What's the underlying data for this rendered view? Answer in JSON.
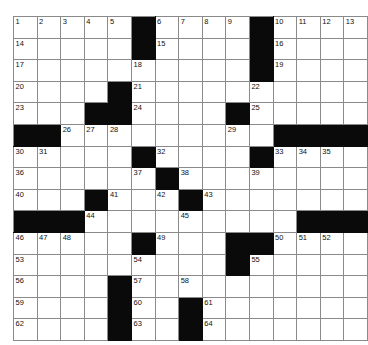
{
  "puzzle": {
    "type": "crossword-grid",
    "title": "Crossword Puzzle Grid",
    "rows": 15,
    "columns": 13,
    "colors": {
      "block": "#0a0a0a",
      "open": "#ffffff",
      "gridline": "#8a8a8a",
      "number": "#111111",
      "background": "#ffffff"
    },
    "grid": [
      [
        {
          "block": false,
          "num": "1"
        },
        {
          "block": false,
          "num": "2"
        },
        {
          "block": false,
          "num": "3"
        },
        {
          "block": false,
          "num": "4"
        },
        {
          "block": false,
          "num": "5"
        },
        {
          "block": true,
          "num": ""
        },
        {
          "block": false,
          "num": "6"
        },
        {
          "block": false,
          "num": "7"
        },
        {
          "block": false,
          "num": "8"
        },
        {
          "block": false,
          "num": "9"
        },
        {
          "block": true,
          "num": ""
        },
        {
          "block": false,
          "num": "10"
        },
        {
          "block": false,
          "num": "11"
        },
        {
          "block": false,
          "num": "12"
        },
        {
          "block": false,
          "num": "13"
        }
      ],
      [
        {
          "block": false,
          "num": "14"
        },
        {
          "block": false,
          "num": ""
        },
        {
          "block": false,
          "num": ""
        },
        {
          "block": false,
          "num": ""
        },
        {
          "block": false,
          "num": ""
        },
        {
          "block": true,
          "num": ""
        },
        {
          "block": false,
          "num": "15"
        },
        {
          "block": false,
          "num": ""
        },
        {
          "block": false,
          "num": ""
        },
        {
          "block": false,
          "num": ""
        },
        {
          "block": true,
          "num": ""
        },
        {
          "block": false,
          "num": "16"
        },
        {
          "block": false,
          "num": ""
        },
        {
          "block": false,
          "num": ""
        },
        {
          "block": false,
          "num": ""
        }
      ],
      [
        {
          "block": false,
          "num": "17"
        },
        {
          "block": false,
          "num": ""
        },
        {
          "block": false,
          "num": ""
        },
        {
          "block": false,
          "num": ""
        },
        {
          "block": false,
          "num": ""
        },
        {
          "block": false,
          "num": "18"
        },
        {
          "block": false,
          "num": ""
        },
        {
          "block": false,
          "num": ""
        },
        {
          "block": false,
          "num": ""
        },
        {
          "block": false,
          "num": ""
        },
        {
          "block": true,
          "num": ""
        },
        {
          "block": false,
          "num": "19"
        },
        {
          "block": false,
          "num": ""
        },
        {
          "block": false,
          "num": ""
        },
        {
          "block": false,
          "num": ""
        }
      ],
      [
        {
          "block": false,
          "num": "20"
        },
        {
          "block": false,
          "num": ""
        },
        {
          "block": false,
          "num": ""
        },
        {
          "block": false,
          "num": ""
        },
        {
          "block": true,
          "num": ""
        },
        {
          "block": false,
          "num": "21"
        },
        {
          "block": false,
          "num": ""
        },
        {
          "block": false,
          "num": ""
        },
        {
          "block": false,
          "num": ""
        },
        {
          "block": false,
          "num": ""
        },
        {
          "block": false,
          "num": "22"
        },
        {
          "block": false,
          "num": ""
        },
        {
          "block": false,
          "num": ""
        },
        {
          "block": false,
          "num": ""
        },
        {
          "block": false,
          "num": ""
        }
      ],
      [
        {
          "block": false,
          "num": "23"
        },
        {
          "block": false,
          "num": ""
        },
        {
          "block": false,
          "num": ""
        },
        {
          "block": true,
          "num": ""
        },
        {
          "block": true,
          "num": ""
        },
        {
          "block": false,
          "num": "24"
        },
        {
          "block": false,
          "num": ""
        },
        {
          "block": false,
          "num": ""
        },
        {
          "block": false,
          "num": ""
        },
        {
          "block": true,
          "num": ""
        },
        {
          "block": false,
          "num": "25"
        },
        {
          "block": false,
          "num": ""
        },
        {
          "block": false,
          "num": ""
        },
        {
          "block": false,
          "num": ""
        },
        {
          "block": false,
          "num": ""
        }
      ],
      [
        {
          "block": true,
          "num": ""
        },
        {
          "block": true,
          "num": ""
        },
        {
          "block": false,
          "num": "26"
        },
        {
          "block": false,
          "num": "27"
        },
        {
          "block": false,
          "num": "28"
        },
        {
          "block": false,
          "num": ""
        },
        {
          "block": false,
          "num": ""
        },
        {
          "block": false,
          "num": ""
        },
        {
          "block": false,
          "num": ""
        },
        {
          "block": false,
          "num": "29"
        },
        {
          "block": false,
          "num": ""
        },
        {
          "block": true,
          "num": ""
        },
        {
          "block": true,
          "num": ""
        },
        {
          "block": true,
          "num": ""
        },
        {
          "block": true,
          "num": ""
        }
      ],
      [
        {
          "block": false,
          "num": "30"
        },
        {
          "block": false,
          "num": "31"
        },
        {
          "block": false,
          "num": ""
        },
        {
          "block": false,
          "num": ""
        },
        {
          "block": false,
          "num": ""
        },
        {
          "block": true,
          "num": ""
        },
        {
          "block": false,
          "num": "32"
        },
        {
          "block": false,
          "num": ""
        },
        {
          "block": false,
          "num": ""
        },
        {
          "block": false,
          "num": ""
        },
        {
          "block": true,
          "num": ""
        },
        {
          "block": false,
          "num": "33"
        },
        {
          "block": false,
          "num": "34"
        },
        {
          "block": false,
          "num": "35"
        },
        {
          "block": false,
          "num": ""
        }
      ],
      [
        {
          "block": false,
          "num": "36"
        },
        {
          "block": false,
          "num": ""
        },
        {
          "block": false,
          "num": ""
        },
        {
          "block": false,
          "num": ""
        },
        {
          "block": false,
          "num": ""
        },
        {
          "block": false,
          "num": "37"
        },
        {
          "block": true,
          "num": ""
        },
        {
          "block": false,
          "num": "38"
        },
        {
          "block": false,
          "num": ""
        },
        {
          "block": false,
          "num": ""
        },
        {
          "block": false,
          "num": "39"
        },
        {
          "block": false,
          "num": ""
        },
        {
          "block": false,
          "num": ""
        },
        {
          "block": false,
          "num": ""
        },
        {
          "block": false,
          "num": ""
        }
      ],
      [
        {
          "block": false,
          "num": "40"
        },
        {
          "block": false,
          "num": ""
        },
        {
          "block": false,
          "num": ""
        },
        {
          "block": true,
          "num": ""
        },
        {
          "block": false,
          "num": "41"
        },
        {
          "block": false,
          "num": ""
        },
        {
          "block": false,
          "num": "42"
        },
        {
          "block": true,
          "num": ""
        },
        {
          "block": false,
          "num": "43"
        },
        {
          "block": false,
          "num": ""
        },
        {
          "block": false,
          "num": ""
        },
        {
          "block": false,
          "num": ""
        },
        {
          "block": false,
          "num": ""
        },
        {
          "block": false,
          "num": ""
        },
        {
          "block": false,
          "num": ""
        }
      ],
      [
        {
          "block": true,
          "num": ""
        },
        {
          "block": true,
          "num": ""
        },
        {
          "block": true,
          "num": ""
        },
        {
          "block": false,
          "num": "44"
        },
        {
          "block": false,
          "num": ""
        },
        {
          "block": false,
          "num": ""
        },
        {
          "block": false,
          "num": ""
        },
        {
          "block": false,
          "num": "45"
        },
        {
          "block": false,
          "num": ""
        },
        {
          "block": false,
          "num": ""
        },
        {
          "block": false,
          "num": ""
        },
        {
          "block": false,
          "num": ""
        },
        {
          "block": true,
          "num": ""
        },
        {
          "block": true,
          "num": ""
        },
        {
          "block": true,
          "num": ""
        }
      ],
      [
        {
          "block": false,
          "num": "46"
        },
        {
          "block": false,
          "num": "47"
        },
        {
          "block": false,
          "num": "48"
        },
        {
          "block": false,
          "num": ""
        },
        {
          "block": false,
          "num": ""
        },
        {
          "block": true,
          "num": ""
        },
        {
          "block": false,
          "num": "49"
        },
        {
          "block": false,
          "num": ""
        },
        {
          "block": false,
          "num": ""
        },
        {
          "block": true,
          "num": ""
        },
        {
          "block": true,
          "num": ""
        },
        {
          "block": false,
          "num": "50"
        },
        {
          "block": false,
          "num": "51"
        },
        {
          "block": false,
          "num": "52"
        },
        {
          "block": false,
          "num": ""
        }
      ],
      [
        {
          "block": false,
          "num": "53"
        },
        {
          "block": false,
          "num": ""
        },
        {
          "block": false,
          "num": ""
        },
        {
          "block": false,
          "num": ""
        },
        {
          "block": false,
          "num": ""
        },
        {
          "block": false,
          "num": "54"
        },
        {
          "block": false,
          "num": ""
        },
        {
          "block": false,
          "num": ""
        },
        {
          "block": false,
          "num": ""
        },
        {
          "block": true,
          "num": ""
        },
        {
          "block": false,
          "num": "55"
        },
        {
          "block": false,
          "num": ""
        },
        {
          "block": false,
          "num": ""
        },
        {
          "block": false,
          "num": ""
        },
        {
          "block": false,
          "num": ""
        }
      ],
      [
        {
          "block": false,
          "num": "56"
        },
        {
          "block": false,
          "num": ""
        },
        {
          "block": false,
          "num": ""
        },
        {
          "block": false,
          "num": ""
        },
        {
          "block": true,
          "num": ""
        },
        {
          "block": false,
          "num": "57"
        },
        {
          "block": false,
          "num": ""
        },
        {
          "block": false,
          "num": "58"
        },
        {
          "block": false,
          "num": ""
        },
        {
          "block": false,
          "num": ""
        },
        {
          "block": false,
          "num": ""
        },
        {
          "block": false,
          "num": ""
        },
        {
          "block": false,
          "num": ""
        },
        {
          "block": false,
          "num": ""
        },
        {
          "block": false,
          "num": ""
        }
      ],
      [
        {
          "block": false,
          "num": "59"
        },
        {
          "block": false,
          "num": ""
        },
        {
          "block": false,
          "num": ""
        },
        {
          "block": false,
          "num": ""
        },
        {
          "block": true,
          "num": ""
        },
        {
          "block": false,
          "num": "60"
        },
        {
          "block": false,
          "num": ""
        },
        {
          "block": true,
          "num": ""
        },
        {
          "block": false,
          "num": "61"
        },
        {
          "block": false,
          "num": ""
        },
        {
          "block": false,
          "num": ""
        },
        {
          "block": false,
          "num": ""
        },
        {
          "block": false,
          "num": ""
        },
        {
          "block": false,
          "num": ""
        },
        {
          "block": false,
          "num": ""
        }
      ],
      [
        {
          "block": false,
          "num": "62"
        },
        {
          "block": false,
          "num": ""
        },
        {
          "block": false,
          "num": ""
        },
        {
          "block": false,
          "num": ""
        },
        {
          "block": true,
          "num": ""
        },
        {
          "block": false,
          "num": "63"
        },
        {
          "block": false,
          "num": ""
        },
        {
          "block": true,
          "num": ""
        },
        {
          "block": false,
          "num": "64"
        },
        {
          "block": false,
          "num": ""
        },
        {
          "block": false,
          "num": ""
        },
        {
          "block": false,
          "num": ""
        },
        {
          "block": false,
          "num": ""
        },
        {
          "block": false,
          "num": ""
        },
        {
          "block": false,
          "num": ""
        }
      ]
    ]
  }
}
